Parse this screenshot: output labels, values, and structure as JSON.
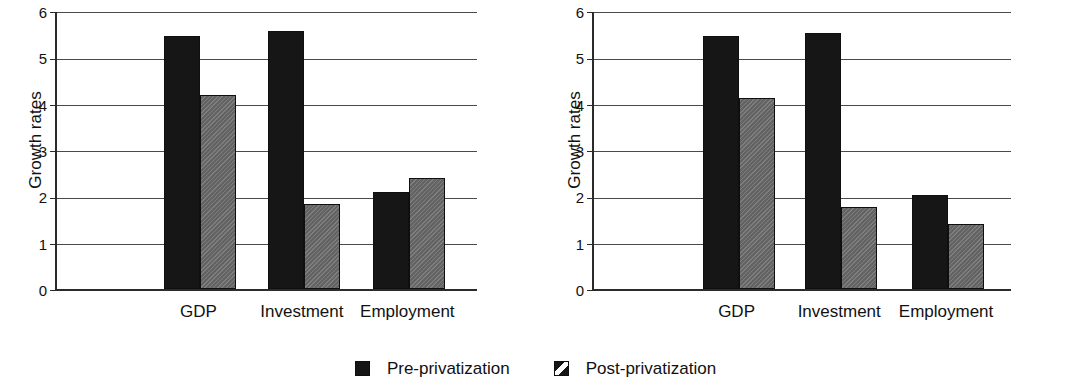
{
  "chart_data": [
    {
      "type": "bar",
      "title": "",
      "panel": "left",
      "xlabel": "",
      "ylabel": "Growth rates",
      "ylim": [
        0,
        6
      ],
      "yticks": [
        "0",
        "1",
        "2",
        "3",
        "4",
        "5",
        "6"
      ],
      "grid": true,
      "legend_position": "bottom-center-shared",
      "categories": [
        "GDP",
        "Investment",
        "Employment"
      ],
      "series": [
        {
          "name": "Pre-privatization",
          "values": [
            5.47,
            5.57,
            2.1
          ]
        },
        {
          "name": "Post-privatization",
          "values": [
            4.18,
            1.83,
            2.4
          ]
        }
      ]
    },
    {
      "type": "bar",
      "title": "",
      "panel": "right",
      "xlabel": "",
      "ylabel": "Growth rates",
      "ylim": [
        0,
        6
      ],
      "yticks": [
        "0",
        "1",
        "2",
        "3",
        "4",
        "5",
        "6"
      ],
      "grid": true,
      "legend_position": "bottom-center-shared",
      "categories": [
        "GDP",
        "Investment",
        "Employment"
      ],
      "series": [
        {
          "name": "Pre-privatization",
          "values": [
            5.45,
            5.52,
            2.03
          ]
        },
        {
          "name": "Post-privatization",
          "values": [
            4.13,
            1.78,
            1.4
          ]
        }
      ]
    }
  ],
  "legend": {
    "items": [
      {
        "label": "Pre-privatization",
        "marker": "solid-square-swatch",
        "color": "#161616"
      },
      {
        "label": "Post-privatization",
        "marker": "hatched-square-swatch",
        "color": "#6e6e6e"
      }
    ]
  },
  "colors": {
    "pre": "#161616",
    "post": "#6e6e6e",
    "axis": "#2b2b2b",
    "grid": "#4a4a4a",
    "background": "#ffffff",
    "text": "#111111"
  }
}
